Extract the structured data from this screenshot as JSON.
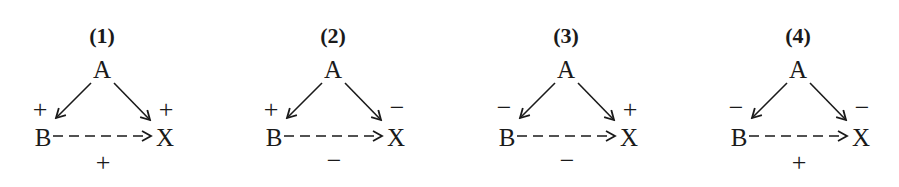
{
  "diagrams": [
    {
      "title": "(1)",
      "nodes": {
        "a": "A",
        "b": "B",
        "x": "X"
      },
      "signs": {
        "ab": "+",
        "ax": "+",
        "bx": "+"
      }
    },
    {
      "title": "(2)",
      "nodes": {
        "a": "A",
        "b": "B",
        "x": "X"
      },
      "signs": {
        "ab": "+",
        "ax": "−",
        "bx": "−"
      }
    },
    {
      "title": "(3)",
      "nodes": {
        "a": "A",
        "b": "B",
        "x": "X"
      },
      "signs": {
        "ab": "−",
        "ax": "+",
        "bx": "−"
      }
    },
    {
      "title": "(4)",
      "nodes": {
        "a": "A",
        "b": "B",
        "x": "X"
      },
      "signs": {
        "ab": "−",
        "ax": "−",
        "bx": "+"
      }
    }
  ],
  "colors": {
    "ink": "#1a1a1a",
    "background": "#ffffff"
  }
}
